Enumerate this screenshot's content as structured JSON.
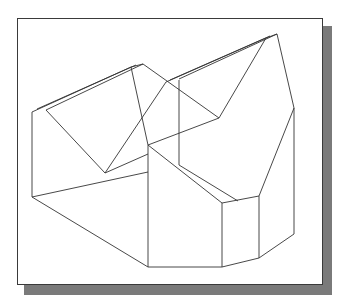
{
  "figure": {
    "type": "isometric wireframe drawing",
    "frame": {
      "shadow_color": "#7a7a7a",
      "border_color": "#3a3a3a",
      "background": "#ffffff"
    },
    "line_color": "#333333",
    "edges": [
      [
        32,
        112,
        32,
        197
      ],
      [
        32,
        112,
        131,
        67
      ],
      [
        37,
        109,
        136,
        65
      ],
      [
        46,
        110,
        143,
        64
      ],
      [
        131,
        67,
        143,
        64
      ],
      [
        46,
        110,
        105,
        173
      ],
      [
        131,
        67,
        148,
        145
      ],
      [
        143,
        64,
        219,
        118
      ],
      [
        105,
        173,
        166,
        82
      ],
      [
        166,
        82,
        266,
        38
      ],
      [
        170,
        80,
        270,
        36
      ],
      [
        179,
        79,
        277,
        34
      ],
      [
        266,
        38,
        277,
        34
      ],
      [
        219,
        118,
        266,
        38
      ],
      [
        277,
        34,
        294,
        108
      ],
      [
        179,
        80,
        179,
        165
      ],
      [
        105,
        173,
        148,
        154
      ],
      [
        148,
        145,
        219,
        118
      ],
      [
        32,
        197,
        148,
        172
      ],
      [
        148,
        145,
        148,
        267
      ],
      [
        148,
        145,
        222,
        203
      ],
      [
        179,
        165,
        238,
        201
      ],
      [
        294,
        108,
        259,
        196
      ],
      [
        222,
        203,
        259,
        196
      ],
      [
        222,
        203,
        222,
        267
      ],
      [
        259,
        196,
        259,
        258
      ],
      [
        32,
        197,
        148,
        267
      ],
      [
        148,
        267,
        222,
        267
      ],
      [
        222,
        267,
        259,
        258
      ],
      [
        259,
        258,
        294,
        234
      ],
      [
        294,
        108,
        294,
        234
      ]
    ]
  }
}
